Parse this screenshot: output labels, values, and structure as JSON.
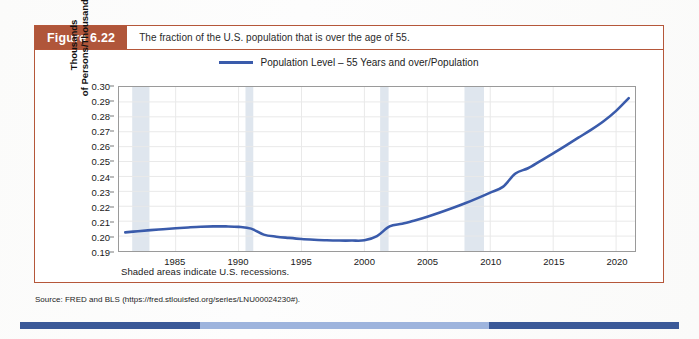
{
  "figure": {
    "tag": "Figure 6.22",
    "caption": "The fraction of the U.S. population that is over the age of 55.",
    "tag_color": "#b0563a",
    "border_color": "#b5573a"
  },
  "source": {
    "text": "Source: FRED and BLS (https://fred.stlouisfed.org/series/LNU00024230#)."
  },
  "chart_data": {
    "type": "line",
    "title": "The fraction of the U.S. population that is over the age of 55.",
    "xlabel": "",
    "ylabel": "Thousands of Persons/Thousands",
    "ylabel_line1": "Thousands",
    "ylabel_line2": "of Persons/Thousands",
    "xlim": [
      1980.5,
      2021.5
    ],
    "ylim": [
      0.19,
      0.3
    ],
    "grid": true,
    "legend_position": "top-center",
    "series": [
      {
        "name": "Population Level – 55 Years and over/Population",
        "color": "#3a5bab",
        "x": [
          1981,
          1982,
          1983,
          1984,
          1985,
          1986,
          1987,
          1988,
          1989,
          1990,
          1991,
          1992,
          1993,
          1994,
          1995,
          1996,
          1997,
          1998,
          1999,
          2000,
          2001,
          2002,
          2003,
          2004,
          2005,
          2006,
          2007,
          2008,
          2009,
          2010,
          2011,
          2012,
          2013,
          2014,
          2015,
          2016,
          2017,
          2018,
          2019,
          2020,
          2021
        ],
        "values": [
          0.2025,
          0.2033,
          0.204,
          0.2046,
          0.2052,
          0.2058,
          0.2063,
          0.2065,
          0.2065,
          0.2062,
          0.205,
          0.201,
          0.1996,
          0.1988,
          0.1981,
          0.1976,
          0.1972,
          0.197,
          0.197,
          0.1972,
          0.2,
          0.2065,
          0.2082,
          0.2105,
          0.213,
          0.2158,
          0.2188,
          0.222,
          0.2255,
          0.2292,
          0.233,
          0.242,
          0.2455,
          0.2505,
          0.2555,
          0.2607,
          0.266,
          0.2712,
          0.277,
          0.284,
          0.2925
        ]
      }
    ],
    "x_ticks": [
      1985,
      1990,
      1995,
      2000,
      2005,
      2010,
      2015,
      2020
    ],
    "x_tick_labels": [
      "1985",
      "1990",
      "1995",
      "2000",
      "2005",
      "2010",
      "2015",
      "2020"
    ],
    "y_ticks": [
      0.19,
      0.2,
      0.21,
      0.22,
      0.23,
      0.24,
      0.25,
      0.26,
      0.27,
      0.28,
      0.29,
      0.3
    ],
    "y_tick_labels": [
      "0.19",
      "0.20",
      "0.21",
      "0.22",
      "0.23",
      "0.24",
      "0.25",
      "0.26",
      "0.27",
      "0.28",
      "0.29",
      "0.30"
    ],
    "recessions": [
      {
        "start": 1981.55,
        "end": 1982.92
      },
      {
        "start": 1990.55,
        "end": 1991.17
      },
      {
        "start": 2001.25,
        "end": 2001.92
      },
      {
        "start": 2007.95,
        "end": 2009.5
      }
    ],
    "recession_note": "Shaded areas indicate U.S. recessions.",
    "recession_color": "#dfe6ee"
  },
  "legend": {
    "label": "Population Level – 55 Years and over/Population",
    "color": "#3a5bab"
  }
}
